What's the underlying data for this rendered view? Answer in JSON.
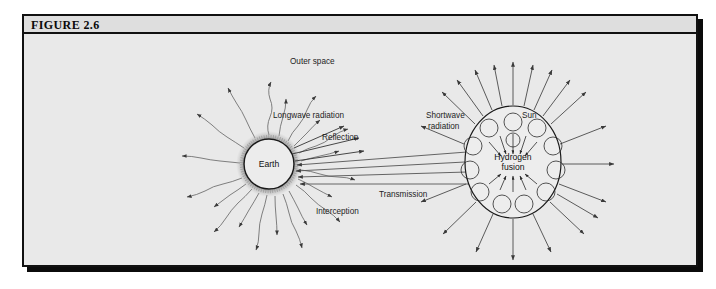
{
  "figure": {
    "label": "FIGURE 2.6",
    "panel_color": "#e9e9e9",
    "header_color": "#dedede",
    "border_color": "#111111",
    "shadow_color": "#0b0b0b"
  },
  "diagram": {
    "type": "scientific-illustration",
    "bodies": [
      {
        "id": "earth",
        "label": "Earth",
        "cx": 245,
        "cy": 130,
        "r": 26,
        "has_atmosphere_halo": true
      },
      {
        "id": "sun",
        "label": "Hydrogen fusion",
        "label_line1": "Hydrogen",
        "label_line2": "fusion",
        "cx": 489,
        "cy": 128,
        "rx": 47,
        "ry": 55,
        "has_convection_cells": true
      }
    ],
    "labels": [
      {
        "id": "outer-space",
        "text": "Outer space",
        "x": 266,
        "y": 30
      },
      {
        "id": "longwave-radiation",
        "text": "Longwave radiation",
        "x": 249,
        "y": 84
      },
      {
        "id": "reflection",
        "text": "Reflection",
        "x": 298,
        "y": 106
      },
      {
        "id": "transmission",
        "text": "Transmission",
        "x": 355,
        "y": 163
      },
      {
        "id": "interception",
        "text": "Interception",
        "x": 292,
        "y": 180
      },
      {
        "id": "shortwave-radiation-line1",
        "text": "Shortwave",
        "x": 402,
        "y": 84
      },
      {
        "id": "shortwave-radiation-line2",
        "text": "radiation",
        "x": 404,
        "y": 95
      },
      {
        "id": "sun",
        "text": "Sun",
        "x": 498,
        "y": 84
      }
    ],
    "earth_label": "Earth",
    "sun_label_line1": "Hydrogen",
    "sun_label_line2": "fusion",
    "longwave_ray_count": 20,
    "sun_ray_count": 20,
    "transmission_beam_count": 4,
    "reflection_arrow_count": 3,
    "colors": {
      "ray": "#4a4a4a",
      "wavy_ray": "#6a6a6a",
      "convection_cell": "#2b2b2b",
      "text": "#1d1d1d"
    }
  }
}
